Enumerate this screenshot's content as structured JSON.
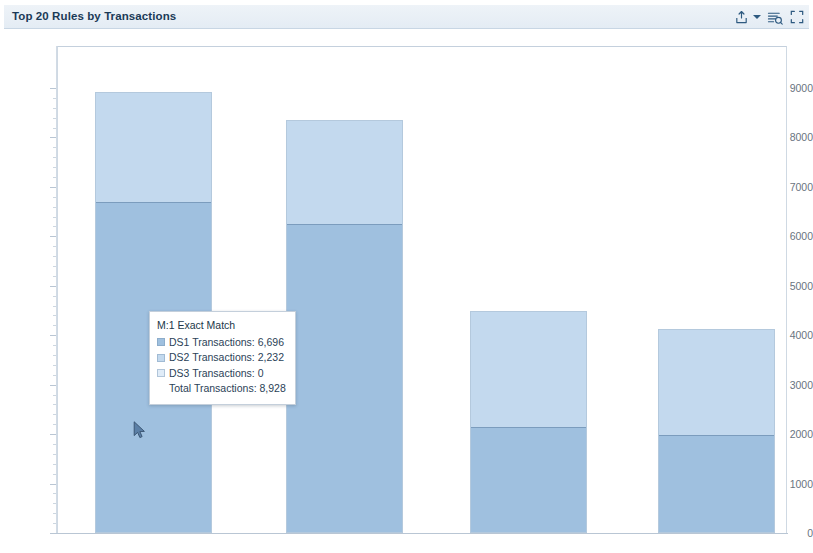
{
  "header": {
    "title": "Top 20 Rules by Transactions",
    "toolbar": [
      {
        "name": "export-icon",
        "label": "Export"
      },
      {
        "name": "export-dropdown-caret",
        "label": "Export options"
      },
      {
        "name": "legend-toggle-icon",
        "label": "Toggle legend"
      },
      {
        "name": "fullscreen-icon",
        "label": "Full screen"
      }
    ]
  },
  "tooltip": {
    "title": "M:1 Exact Match",
    "rows": [
      {
        "label": "DS1 Transactions: 6,696",
        "color": "#9fc0df",
        "swatch": true
      },
      {
        "label": "DS2 Transactions: 2,232",
        "color": "#c3d9ee",
        "swatch": true
      },
      {
        "label": "DS3 Transactions: 0",
        "color": "#e0ecf8",
        "swatch": true
      },
      {
        "label": "Total Transactions: 8,928",
        "color": "",
        "swatch": false
      }
    ]
  },
  "colors": {
    "ds1": "#9fc0df",
    "ds2": "#c3d9ee",
    "ds3": "#e0ecf8",
    "header_bg": "#e8eef5",
    "title_text": "#1b3a57",
    "axis_text": "#6a7480",
    "plot_border": "#cfd9e3"
  },
  "chart_data": {
    "type": "bar",
    "subtype": "stacked-vertical",
    "title": "Top 20 Rules by Transactions",
    "xlabel": "",
    "ylabel": "",
    "ylim": [
      0,
      9400
    ],
    "ytick_labels": [
      "0",
      "1000",
      "2000",
      "3000",
      "4000",
      "5000",
      "6000",
      "7000",
      "8000",
      "9000"
    ],
    "ytick_values": [
      0,
      1000,
      2000,
      3000,
      4000,
      5000,
      6000,
      7000,
      8000,
      9000
    ],
    "grid": false,
    "legend": "none",
    "categories": [
      "M:1 Exact Match",
      "Rule 2",
      "Rule 3",
      "Rule 4"
    ],
    "series": [
      {
        "name": "DS1 Transactions",
        "color": "#9fc0df",
        "values": [
          6696,
          6250,
          2150,
          1980
        ]
      },
      {
        "name": "DS2 Transactions",
        "color": "#c3d9ee",
        "values": [
          2232,
          2100,
          2330,
          2140
        ]
      },
      {
        "name": "DS3 Transactions",
        "color": "#e0ecf8",
        "values": [
          0,
          0,
          0,
          0
        ]
      }
    ],
    "totals": [
      8928,
      8350,
      4480,
      4120
    ],
    "highlighted_category": "M:1 Exact Match"
  }
}
